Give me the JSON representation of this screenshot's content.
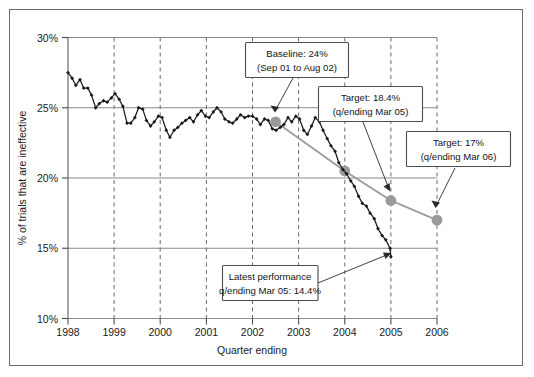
{
  "chart_data": {
    "type": "line",
    "title": "",
    "xlabel": "Quarter ending",
    "ylabel": "% of trials that are ineffective",
    "xlim": [
      1998,
      2006
    ],
    "ylim": [
      10,
      30
    ],
    "grid": "vertical dashed at each year; horizontal solid at each 5%",
    "ytick_labels": [
      "10%",
      "15%",
      "20%",
      "25%",
      "30%"
    ],
    "ytick_values": [
      10,
      15,
      20,
      25,
      30
    ],
    "xtick_labels": [
      "1998",
      "1999",
      "2000",
      "2001",
      "2002",
      "2003",
      "2004",
      "2005",
      "2006"
    ],
    "xtick_values": [
      1998,
      1999,
      2000,
      2001,
      2002,
      2003,
      2004,
      2005,
      2006
    ],
    "legend": "none",
    "series": [
      {
        "name": "% of trials that are ineffective (actual)",
        "style": "black line with small filled diamond markers",
        "color": "#1a1a1a",
        "x": [
          1998.0,
          1998.09,
          1998.17,
          1998.26,
          1998.34,
          1998.43,
          1998.51,
          1998.6,
          1998.68,
          1998.77,
          1998.85,
          1998.94,
          1999.02,
          1999.11,
          1999.19,
          1999.28,
          1999.36,
          1999.45,
          1999.53,
          1999.62,
          1999.7,
          1999.79,
          1999.87,
          1999.96,
          2000.04,
          2000.13,
          2000.21,
          2000.3,
          2000.38,
          2000.47,
          2000.55,
          2000.64,
          2000.72,
          2000.81,
          2000.89,
          2000.98,
          2001.06,
          2001.15,
          2001.23,
          2001.32,
          2001.4,
          2001.49,
          2001.57,
          2001.66,
          2001.74,
          2001.83,
          2001.91,
          2002.0,
          2002.09,
          2002.17,
          2002.26,
          2002.34,
          2002.43,
          2002.51,
          2002.6,
          2002.68,
          2002.77,
          2002.85,
          2002.94,
          2003.02,
          2003.11,
          2003.19,
          2003.28,
          2003.36,
          2003.45,
          2003.53,
          2003.62,
          2003.7,
          2003.79,
          2003.87,
          2003.96,
          2004.04,
          2004.13,
          2004.21,
          2004.3,
          2004.38,
          2004.47,
          2004.55,
          2004.64,
          2004.72,
          2004.81,
          2004.89,
          2004.98,
          2005.0
        ],
        "y": [
          27.5,
          27.1,
          26.6,
          27.0,
          26.4,
          26.4,
          25.9,
          25.0,
          25.3,
          25.5,
          25.4,
          25.7,
          26.0,
          25.6,
          25.1,
          23.9,
          23.9,
          24.3,
          25.0,
          24.9,
          24.1,
          23.7,
          24.0,
          24.4,
          24.3,
          23.4,
          22.9,
          23.4,
          23.6,
          23.9,
          24.1,
          24.3,
          24.0,
          24.5,
          24.8,
          24.4,
          24.3,
          24.7,
          25.0,
          24.7,
          24.2,
          24.0,
          23.9,
          24.2,
          24.5,
          24.3,
          24.4,
          24.4,
          24.2,
          23.8,
          24.2,
          24.1,
          23.5,
          23.4,
          23.6,
          23.8,
          24.3,
          24.0,
          24.4,
          24.2,
          23.4,
          23.1,
          23.7,
          24.3,
          24.0,
          23.4,
          22.8,
          22.3,
          21.9,
          21.1,
          20.6,
          20.3,
          19.8,
          19.4,
          18.7,
          18.2,
          18.0,
          17.5,
          17.1,
          16.4,
          15.9,
          15.6,
          15.0,
          14.4
        ]
      },
      {
        "name": "Trajectory / target line",
        "style": "grey line with large grey circle markers",
        "color": "#9a9a9a",
        "x": [
          2002.5,
          2004.0,
          2005.0,
          2006.0
        ],
        "y": [
          24.0,
          20.5,
          18.4,
          17.0
        ]
      }
    ],
    "annotations": [
      {
        "id": "baseline",
        "line1": "Baseline: 24%",
        "line2": "(Sep 01 to Aug 02)",
        "points_to": {
          "x": 2002.5,
          "y": 24.0
        }
      },
      {
        "id": "target-mar-05",
        "line1": "Target: 18.4%",
        "line2": "(q/ending Mar 05)",
        "points_to": {
          "x": 2005.0,
          "y": 18.4
        }
      },
      {
        "id": "target-mar-06",
        "line1": "Target: 17%",
        "line2": "(q/ending Mar 06)",
        "points_to": {
          "x": 2006.0,
          "y": 17.0
        }
      },
      {
        "id": "latest-performance",
        "line1": "Latest performance",
        "line2": "q/ending Mar 05: 14.4%",
        "points_to": {
          "x": 2005.0,
          "y": 14.4
        }
      }
    ],
    "colors": {
      "actual_line": "#1a1a1a",
      "target_line": "#9a9a9a",
      "target_marker": "#9a9a9a",
      "gridline_horizontal": "#8a8a8a",
      "gridline_vertical_dashed": "#6b6b6b",
      "frame_border": "#6d6d6d",
      "background": "#ffffff"
    }
  },
  "axes": {
    "y_title": "% of trials that are ineffective",
    "x_title": "Quarter ending",
    "y_labels": [
      "30%",
      "25%",
      "20%",
      "15%",
      "10%"
    ],
    "x_labels": [
      "1998",
      "1999",
      "2000",
      "2001",
      "2002",
      "2003",
      "2004",
      "2005",
      "2006"
    ]
  },
  "callouts": {
    "baseline": {
      "line1": "Baseline: 24%",
      "line2": "(Sep 01 to Aug 02)"
    },
    "target05": {
      "line1": "Target: 18.4%",
      "line2": "(q/ending Mar 05)"
    },
    "target06": {
      "line1": "Target: 17%",
      "line2": "(q/ending Mar 06)"
    },
    "latest": {
      "line1": "Latest performance",
      "line2": "q/ending Mar 05: 14.4%"
    }
  }
}
